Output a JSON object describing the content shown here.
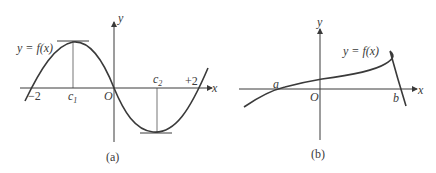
{
  "figures": [
    {
      "id": "a",
      "caption": "(a)",
      "curve_label": "y = f(x)",
      "axis_x_label": "x",
      "axis_y_label": "y",
      "origin_label": "O",
      "left_root_label": "−2",
      "right_root_label": "+2",
      "max_point_label": "c",
      "max_point_sub": "1",
      "min_point_label": "c",
      "min_point_sub": "2"
    },
    {
      "id": "b",
      "caption": "(b)",
      "curve_label": "y = f(x)",
      "axis_x_label": "x",
      "axis_y_label": "y",
      "origin_label": "O",
      "left_endpoint_label": "a",
      "right_endpoint_label": "b"
    }
  ],
  "colors": {
    "curve": "#3a3a3a",
    "axis": "#3a3a3a",
    "background": "#ffffff"
  }
}
